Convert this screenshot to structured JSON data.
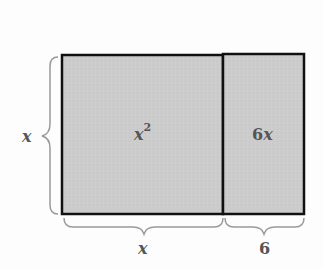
{
  "diagram": {
    "type": "area-model",
    "regions": [
      {
        "name": "square",
        "label_base": "x",
        "label_exp": "2"
      },
      {
        "name": "strip",
        "label": "6x"
      }
    ],
    "dimensions": {
      "height_label": "x",
      "bottom_left_label": "x",
      "bottom_right_label": "6"
    },
    "colors": {
      "fill": "#cccccc",
      "stroke": "#111111",
      "brace": "#999999",
      "text": "#555555"
    }
  }
}
